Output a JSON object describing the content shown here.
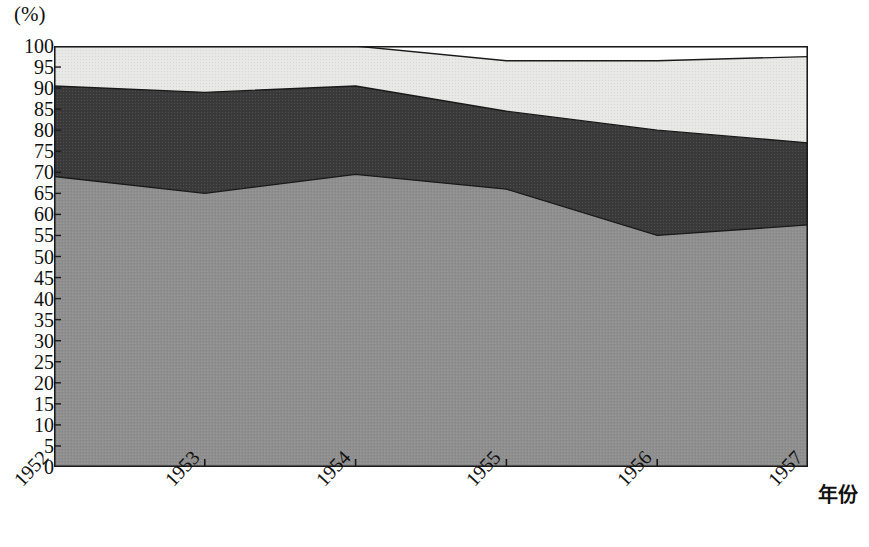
{
  "chart_data": {
    "type": "area",
    "title": "",
    "subtitle": "",
    "xlabel": "年份",
    "ylabel": "(%)",
    "stacked": true,
    "grid": false,
    "legend_position": "none",
    "x": [
      "1952",
      "1953",
      "1954",
      "1955",
      "1956",
      "1957"
    ],
    "categories": [
      "1952",
      "1953",
      "1954",
      "1955",
      "1956",
      "1957"
    ],
    "xlim": [
      1952,
      1957
    ],
    "ylim": [
      0,
      100
    ],
    "y_ticks": [
      0,
      5,
      10,
      15,
      20,
      25,
      30,
      35,
      40,
      45,
      50,
      55,
      60,
      65,
      70,
      75,
      80,
      85,
      90,
      95,
      100
    ],
    "y_tick_labels": [
      "0",
      "5",
      "10",
      "15",
      "20",
      "25",
      "30",
      "35",
      "40",
      "45",
      "50",
      "55",
      "60",
      "65",
      "70",
      "75",
      "80",
      "85",
      "90",
      "95",
      "100"
    ],
    "series": [
      {
        "name": "series-1-medium-gray",
        "color": "#8f8f8f",
        "cumulative_top": [
          69.0,
          65.0,
          69.5,
          66.0,
          55.0,
          57.5
        ],
        "values": [
          69.0,
          65.0,
          69.5,
          66.0,
          55.0,
          57.5
        ]
      },
      {
        "name": "series-2-dark-gray",
        "color": "#3a3a3a",
        "cumulative_top": [
          90.5,
          89.0,
          90.5,
          84.5,
          80.0,
          77.0
        ],
        "values": [
          21.5,
          24.0,
          21.0,
          18.5,
          25.0,
          19.5
        ]
      },
      {
        "name": "series-3-light-gray",
        "color": "#e8e8e6",
        "cumulative_top": [
          100.0,
          100.0,
          100.0,
          96.5,
          96.5,
          97.5
        ],
        "values": [
          9.5,
          11.0,
          9.5,
          12.0,
          16.5,
          20.5
        ]
      }
    ],
    "plot_area_px": {
      "left": 54,
      "top": 46,
      "right": 808,
      "bottom": 467
    },
    "frame_color": "#1a1a1a"
  },
  "axis": {
    "unit_label": "(%)",
    "x_title": "年份"
  }
}
